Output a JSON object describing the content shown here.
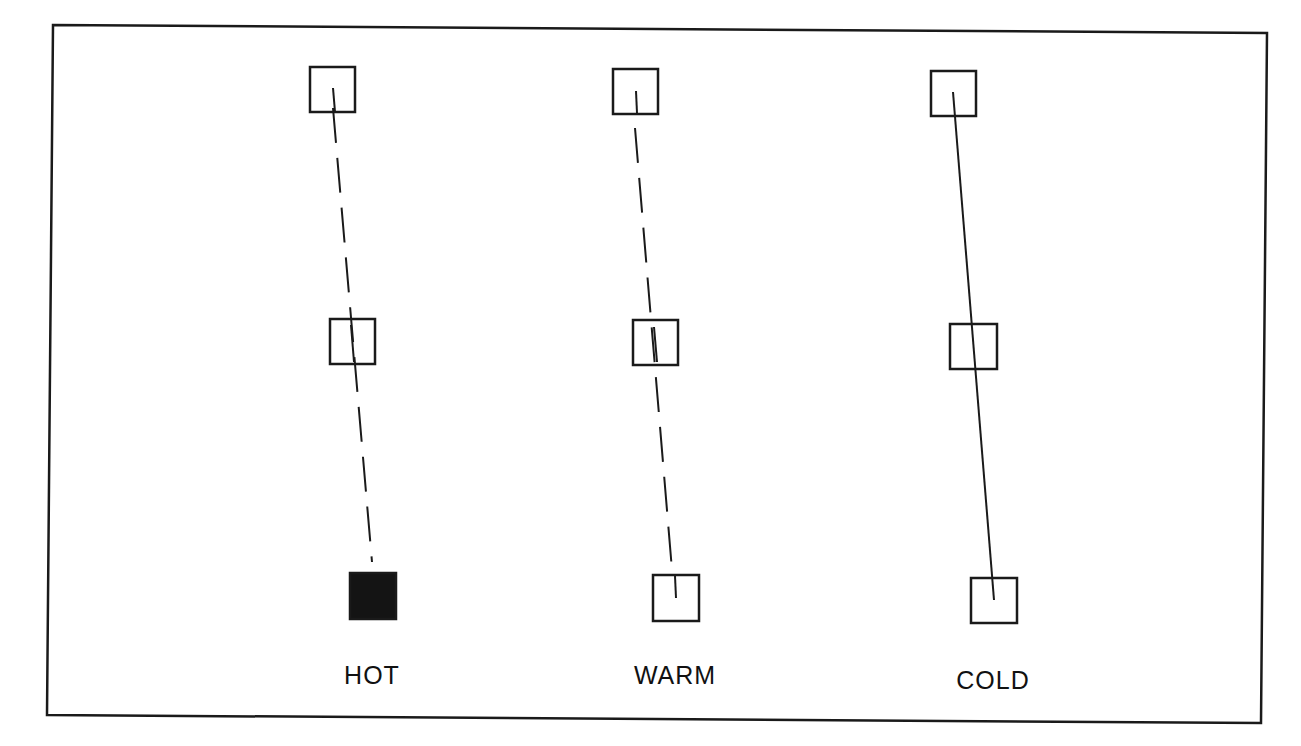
{
  "diagram": {
    "type": "three-column node trajectory diagram",
    "frame": {
      "corners": [
        [
          53,
          25
        ],
        [
          1267,
          33
        ],
        [
          1261,
          723
        ],
        [
          47,
          715
        ]
      ],
      "stroke": "#1a1a1a"
    },
    "columns": [
      {
        "id": "hot",
        "label": "HOT",
        "label_pos": [
          372,
          676
        ],
        "line_style": "dashed",
        "line": [
          [
            333,
            108
          ],
          [
            372,
            562
          ]
        ],
        "nodes": [
          {
            "x": 310,
            "y": 67,
            "w": 45,
            "h": 45,
            "filled": false,
            "tick": [
              [
                333,
                88
              ],
              [
                335,
                112
              ]
            ]
          },
          {
            "x": 330,
            "y": 319,
            "w": 45,
            "h": 45,
            "filled": false,
            "tick": [
              [
                351,
                325
              ],
              [
                354,
                362
              ]
            ]
          },
          {
            "x": 350,
            "y": 573,
            "w": 46,
            "h": 46,
            "filled": true,
            "tick": null
          }
        ]
      },
      {
        "id": "warm",
        "label": "WARM",
        "label_pos": [
          675,
          676
        ],
        "line_style": "dashed",
        "line": [
          [
            635,
            128
          ],
          [
            672,
            570
          ]
        ],
        "nodes": [
          {
            "x": 613,
            "y": 69,
            "w": 45,
            "h": 45,
            "filled": false,
            "tick": [
              [
                636,
                91
              ],
              [
                637,
                113
              ]
            ]
          },
          {
            "x": 633,
            "y": 320,
            "w": 45,
            "h": 45,
            "filled": false,
            "tick": [
              [
                654,
                327
              ],
              [
                657,
                362
              ]
            ]
          },
          {
            "x": 653,
            "y": 575,
            "w": 46,
            "h": 46,
            "filled": false,
            "tick": [
              [
                675,
                576
              ],
              [
                676,
                598
              ]
            ]
          }
        ]
      },
      {
        "id": "cold",
        "label": "COLD",
        "label_pos": [
          993,
          681
        ],
        "line_style": "solid",
        "line": [
          [
            953,
            92
          ],
          [
            994,
            600
          ]
        ],
        "nodes": [
          {
            "x": 931,
            "y": 71,
            "w": 45,
            "h": 45,
            "filled": false,
            "tick": null
          },
          {
            "x": 950,
            "y": 324,
            "w": 47,
            "h": 45,
            "filled": false,
            "tick": null
          },
          {
            "x": 971,
            "y": 578,
            "w": 46,
            "h": 45,
            "filled": false,
            "tick": null
          }
        ]
      }
    ],
    "colors": {
      "ink": "#1a1a1a",
      "fill": "#141414",
      "background": "#ffffff"
    }
  }
}
